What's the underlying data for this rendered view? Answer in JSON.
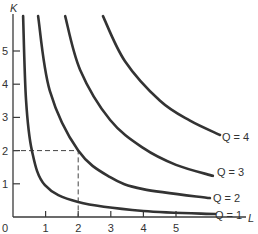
{
  "chart_data": {
    "type": "line",
    "title": "",
    "xlabel": "L",
    "ylabel": "K",
    "origin_label": "0",
    "xlim": [
      0,
      6.4
    ],
    "ylim": [
      0,
      6.05
    ],
    "x_ticks": [
      1,
      2,
      3,
      4,
      5
    ],
    "y_ticks": [
      1,
      2,
      3,
      4,
      5
    ],
    "grid": false,
    "legend": "inline labels at right end of each curve",
    "series": [
      {
        "name": "Q = 1",
        "label": "Q = 1",
        "points": [
          [
            0.31,
            6.05
          ],
          [
            0.4,
            3.52
          ],
          [
            0.58,
            2.0
          ],
          [
            0.98,
            0.96
          ],
          [
            2.0,
            0.45
          ],
          [
            4.0,
            0.18
          ],
          [
            6.2,
            0.09
          ]
        ]
      },
      {
        "name": "Q = 2",
        "label": "Q = 2",
        "points": [
          [
            0.77,
            6.05
          ],
          [
            1.13,
            3.8
          ],
          [
            2.0,
            2.0
          ],
          [
            2.98,
            1.2
          ],
          [
            3.99,
            0.84
          ],
          [
            6.04,
            0.57
          ]
        ]
      },
      {
        "name": "Q = 3",
        "label": "Q = 3",
        "points": [
          [
            1.6,
            6.05
          ],
          [
            2.06,
            4.43
          ],
          [
            2.98,
            2.92
          ],
          [
            3.99,
            2.08
          ],
          [
            5.0,
            1.57
          ],
          [
            6.13,
            1.24
          ]
        ]
      },
      {
        "name": "Q = 4",
        "label": "Q = 4",
        "points": [
          [
            2.76,
            6.05
          ],
          [
            3.43,
            4.7
          ],
          [
            4.51,
            3.5
          ],
          [
            5.43,
            2.9
          ],
          [
            6.35,
            2.47
          ]
        ]
      }
    ],
    "annotations": [
      {
        "type": "dashed-guide",
        "point": [
          2,
          2
        ],
        "on_series": "Q = 2",
        "description": "Dashed lines from axes to point L=2, K=2"
      }
    ]
  },
  "axis": {
    "x_label": "L",
    "y_label": "K",
    "origin": "0",
    "x_tick_labels": [
      "1",
      "2",
      "3",
      "4",
      "5"
    ],
    "y_tick_labels": [
      "1",
      "2",
      "3",
      "4",
      "5"
    ]
  },
  "labels": {
    "q1": "Q = 1",
    "q2": "Q = 2",
    "q3": "Q = 3",
    "q4": "Q = 4"
  }
}
